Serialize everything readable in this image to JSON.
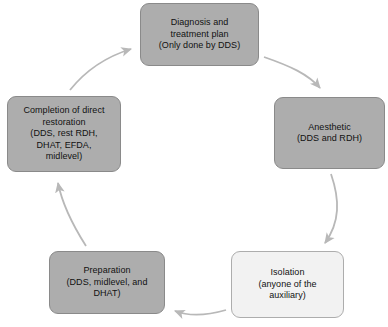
{
  "diagram": {
    "type": "cycle-flowchart",
    "accent_gray": "#adadad",
    "accent_light": "#f2f2f2",
    "arrow_color": "#b8b8b8",
    "nodes": [
      {
        "id": "diagnosis",
        "label": "Diagnosis and\ntreatment plan\n(Only done by DDS)",
        "fill": "gray"
      },
      {
        "id": "anesthetic",
        "label": "Anesthetic\n(DDS and RDH)",
        "fill": "gray"
      },
      {
        "id": "isolation",
        "label": "Isolation\n(anyone of the\nauxiliary)",
        "fill": "light"
      },
      {
        "id": "preparation",
        "label": "Preparation\n(DDS, midlevel, and\nDHAT)",
        "fill": "gray"
      },
      {
        "id": "completion",
        "label": "Completion of direct\nrestoration\n(DDS, rest RDH,\nDHAT, EFDA,\nmidlevel)",
        "fill": "gray"
      }
    ],
    "edges": [
      {
        "id": "diagnosis-to-anesthetic",
        "from": "diagnosis",
        "to": "anesthetic"
      },
      {
        "id": "anesthetic-to-isolation",
        "from": "anesthetic",
        "to": "isolation"
      },
      {
        "id": "isolation-to-preparation",
        "from": "isolation",
        "to": "preparation"
      },
      {
        "id": "preparation-to-completion",
        "from": "preparation",
        "to": "completion"
      },
      {
        "id": "completion-to-diagnosis",
        "from": "completion",
        "to": "diagnosis"
      }
    ]
  }
}
